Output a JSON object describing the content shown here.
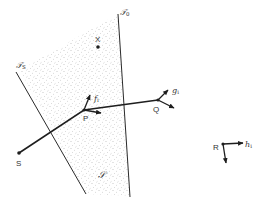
{
  "diagram": {
    "type": "geometric-illustration",
    "colors": {
      "line": "#2a2a2a",
      "stipple": "#9a9a9a",
      "label": "#333333",
      "background": "#ffffff"
    },
    "region": {
      "label": "𝒮",
      "description": "stippled region bounded by planes T0 and Ts"
    },
    "planes": [
      {
        "id": "T0",
        "label_main": "𝒯",
        "label_sub": "0"
      },
      {
        "id": "Ts",
        "label_main": "𝒯",
        "label_sub": "S"
      }
    ],
    "points": [
      {
        "id": "X",
        "label": "X"
      },
      {
        "id": "P",
        "label": "P"
      },
      {
        "id": "Q",
        "label": "Q"
      },
      {
        "id": "S",
        "label": "S"
      },
      {
        "id": "R",
        "label": "R"
      }
    ],
    "vectors": [
      {
        "id": "f",
        "label_main": "f",
        "label_sub": "i",
        "origin": "P"
      },
      {
        "id": "g",
        "label_main": "g",
        "label_sub": "i",
        "origin": "Q"
      },
      {
        "id": "h",
        "label_main": "h",
        "label_sub": "i",
        "origin": "R"
      }
    ]
  }
}
